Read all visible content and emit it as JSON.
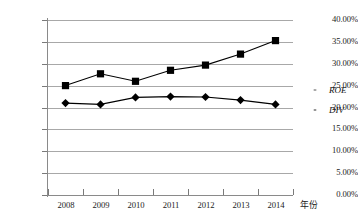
{
  "chart_data": {
    "type": "line",
    "title": "",
    "xlabel": "年份",
    "ylabel": "",
    "categories": [
      "2008",
      "2009",
      "2010",
      "2011",
      "2012",
      "2013",
      "2014"
    ],
    "x": [
      2008,
      2009,
      2010,
      2011,
      2012,
      2013,
      2014
    ],
    "ylim": [
      0,
      40
    ],
    "ytick_labels": [
      "0.00%",
      "5.00%",
      "10.00%",
      "15.00%",
      "20.00%",
      "25.00%",
      "30.00%",
      "35.00%",
      "40.00%"
    ],
    "ytick_values": [
      0,
      5,
      10,
      15,
      20,
      25,
      30,
      35,
      40
    ],
    "grid": true,
    "legend_position": "right",
    "series": [
      {
        "name": "ROE",
        "marker": "diamond",
        "color": "#000000",
        "values": [
          21.0,
          20.7,
          22.3,
          22.5,
          22.4,
          21.7,
          20.7
        ]
      },
      {
        "name": "DIV",
        "marker": "square",
        "color": "#000000",
        "values": [
          25.0,
          27.7,
          26.0,
          28.5,
          29.7,
          32.2,
          35.3
        ]
      }
    ]
  },
  "legend": {
    "items": [
      {
        "label": "ROE",
        "marker": "diamond"
      },
      {
        "label": "DIV",
        "marker": "square"
      }
    ]
  },
  "colors": {
    "series": "#000000",
    "gridline": "#a8a8a8",
    "axis": "#8a8a8a",
    "background": "#ffffff"
  }
}
